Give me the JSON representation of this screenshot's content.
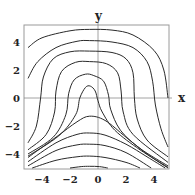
{
  "chart_data": {
    "type": "line",
    "title": "",
    "xlabel": "x",
    "ylabel": "y",
    "xlim": [
      -5.3,
      5.0
    ],
    "ylim": [
      -5.1,
      5.2
    ],
    "grid": false,
    "legend": null,
    "x_ticks": [
      "-4",
      "-2",
      "0",
      "2",
      "4"
    ],
    "y_ticks": [
      "4",
      "2",
      "0",
      "-2",
      "-4"
    ],
    "series": [
      {
        "name": "curve-1",
        "points": [
          [
            -5,
            3.6
          ],
          [
            -4,
            4.3
          ],
          [
            -2,
            4.8
          ],
          [
            -0.6,
            4.9
          ],
          [
            1,
            4.85
          ],
          [
            2.5,
            4.5
          ],
          [
            4,
            3.4
          ],
          [
            4.7,
            2
          ],
          [
            5,
            0
          ]
        ]
      },
      {
        "name": "curve-2",
        "points": [
          [
            -5,
            1.4
          ],
          [
            -4.3,
            2.6
          ],
          [
            -3,
            3.6
          ],
          [
            -1.5,
            4.05
          ],
          [
            -0.6,
            4.1
          ],
          [
            1,
            4.0
          ],
          [
            2.5,
            3.6
          ],
          [
            3.5,
            2.6
          ],
          [
            3.9,
            1.2
          ],
          [
            4.1,
            -0.5
          ],
          [
            4.5,
            -2.2
          ],
          [
            5,
            -3.5
          ]
        ]
      },
      {
        "name": "curve-3",
        "points": [
          [
            -5,
            -3.2
          ],
          [
            -4.4,
            -2
          ],
          [
            -4.1,
            0
          ],
          [
            -3.9,
            1.5
          ],
          [
            -3.2,
            2.8
          ],
          [
            -2,
            3.3
          ],
          [
            -0.6,
            3.35
          ],
          [
            1,
            3.25
          ],
          [
            2,
            2.8
          ],
          [
            2.5,
            1.8
          ],
          [
            2.6,
            0
          ],
          [
            2.8,
            -1.5
          ],
          [
            3.5,
            -3
          ],
          [
            5,
            -4.2
          ]
        ]
      },
      {
        "name": "curve-4",
        "points": [
          [
            -5,
            -3.7
          ],
          [
            -3.7,
            -2.6
          ],
          [
            -3.1,
            -1
          ],
          [
            -3,
            0.5
          ],
          [
            -2.6,
            1.9
          ],
          [
            -1.6,
            2.55
          ],
          [
            -0.6,
            2.6
          ],
          [
            0.6,
            2.45
          ],
          [
            1.4,
            1.8
          ],
          [
            1.65,
            0.5
          ],
          [
            1.8,
            -1
          ],
          [
            2.5,
            -2.6
          ],
          [
            5,
            -4.6
          ]
        ]
      },
      {
        "name": "curve-5",
        "points": [
          [
            -5,
            -4.0
          ],
          [
            -3.2,
            -2.8
          ],
          [
            -2.3,
            -1.2
          ],
          [
            -2.1,
            0.3
          ],
          [
            -1.7,
            1.3
          ],
          [
            -0.9,
            1.7
          ],
          [
            -0.3,
            1.6
          ],
          [
            0.4,
            1.2
          ],
          [
            0.75,
            0.2
          ],
          [
            0.9,
            -0.8
          ],
          [
            1.6,
            -2.3
          ],
          [
            3,
            -3.6
          ],
          [
            5,
            -4.85
          ]
        ]
      },
      {
        "name": "curve-6",
        "points": [
          [
            -5,
            -4.15
          ],
          [
            -2.8,
            -2.7
          ],
          [
            -1.6,
            -1.2
          ],
          [
            -1.3,
            0
          ],
          [
            -0.9,
            0.75
          ],
          [
            -0.55,
            0.85
          ],
          [
            -0.2,
            0.5
          ],
          [
            0,
            -0.2
          ],
          [
            0.3,
            -1
          ],
          [
            1.2,
            -2.3
          ],
          [
            3,
            -3.7
          ],
          [
            5,
            -4.95
          ]
        ]
      },
      {
        "name": "curve-7",
        "points": [
          [
            -5,
            -4.25
          ],
          [
            -3,
            -2.8
          ],
          [
            -1.5,
            -1.7
          ],
          [
            -0.6,
            -1.3
          ],
          [
            0.5,
            -1.6
          ],
          [
            2,
            -2.8
          ],
          [
            3.5,
            -4
          ],
          [
            5,
            -5.0
          ]
        ]
      },
      {
        "name": "curve-8",
        "points": [
          [
            -5,
            -4.55
          ],
          [
            -3,
            -3.2
          ],
          [
            -1.5,
            -2.6
          ],
          [
            -0.6,
            -2.5
          ],
          [
            0.5,
            -2.65
          ],
          [
            2,
            -3.3
          ],
          [
            3.5,
            -4.2
          ],
          [
            4.8,
            -5.0
          ]
        ]
      },
      {
        "name": "curve-9",
        "points": [
          [
            -5,
            -4.85
          ],
          [
            -3,
            -3.75
          ],
          [
            -1.5,
            -3.35
          ],
          [
            -0.6,
            -3.3
          ],
          [
            0.5,
            -3.4
          ],
          [
            2,
            -3.9
          ],
          [
            3.8,
            -5.0
          ]
        ]
      },
      {
        "name": "curve-10",
        "points": [
          [
            -4.7,
            -5.0
          ],
          [
            -3,
            -4.45
          ],
          [
            -1.5,
            -4.2
          ],
          [
            -0.6,
            -4.15
          ],
          [
            0.5,
            -4.25
          ],
          [
            2,
            -4.6
          ],
          [
            3,
            -5.0
          ]
        ]
      },
      {
        "name": "curve-11",
        "points": [
          [
            -2.0,
            -5.0
          ],
          [
            -1.2,
            -4.9
          ],
          [
            -0.6,
            -4.88
          ],
          [
            0.1,
            -4.9
          ],
          [
            0.7,
            -5.0
          ]
        ]
      }
    ]
  },
  "axes": {
    "x_label": "x",
    "y_label": "y",
    "x_ticks": [
      {
        "v": -4,
        "label": "−4"
      },
      {
        "v": -2,
        "label": "−2"
      },
      {
        "v": 0,
        "label": "0"
      },
      {
        "v": 2,
        "label": "2"
      },
      {
        "v": 4,
        "label": "4"
      }
    ],
    "y_ticks": [
      {
        "v": 4,
        "label": "4"
      },
      {
        "v": 2,
        "label": "2"
      },
      {
        "v": 0,
        "label": "0"
      },
      {
        "v": -2,
        "label": "−2"
      },
      {
        "v": -4,
        "label": "−4"
      }
    ]
  }
}
